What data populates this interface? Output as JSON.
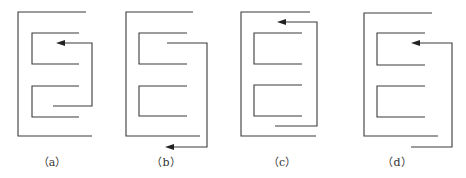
{
  "figure": {
    "panels": [
      {
        "id": "a",
        "label": "（a）",
        "label_x": 52,
        "arrow_direction": "left",
        "arrow_position": "upper-inner"
      },
      {
        "id": "b",
        "label": "（b）",
        "label_x": 166,
        "arrow_direction": "left",
        "arrow_position": "bottom-outer"
      },
      {
        "id": "c",
        "label": "（c）",
        "label_x": 282,
        "arrow_direction": "left",
        "arrow_position": "top-outer"
      },
      {
        "id": "d",
        "label": "（d）",
        "label_x": 397,
        "arrow_direction": "left",
        "arrow_position": "upper-inner"
      }
    ],
    "colors": {
      "line": "#3a3a3a",
      "background": "#ffffff"
    }
  }
}
